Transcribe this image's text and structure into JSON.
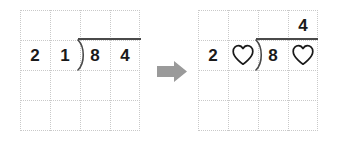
{
  "diagram": {
    "background_color": "#ffffff",
    "grid_line_color": "#c9c9c9",
    "ink_color": "#1a1a1a",
    "rule_color": "#4a4a4a",
    "arrow_color": "#9a9a9a"
  },
  "left_panel": {
    "name": "original-problem",
    "columns": 4,
    "rows": 4,
    "expression": "21 ) 84",
    "divisor_digits": [
      "2",
      "1"
    ],
    "dividend_digits": [
      "8",
      "4"
    ],
    "quotient_digits": [],
    "cells": [
      {
        "row": 1,
        "col": 0,
        "type": "digit",
        "value": "2"
      },
      {
        "row": 1,
        "col": 1,
        "type": "digit",
        "value": "1"
      },
      {
        "row": 1,
        "col": 2,
        "type": "digit",
        "value": "8"
      },
      {
        "row": 1,
        "col": 3,
        "type": "digit",
        "value": "4"
      }
    ],
    "division_bracket": {
      "present": true,
      "bar_label": "division-bar"
    }
  },
  "right_panel": {
    "name": "puzzle-problem",
    "columns": 4,
    "rows": 4,
    "expression": "2? ) 8?  =  4",
    "divisor_digits": [
      "2",
      "heart"
    ],
    "dividend_digits": [
      "8",
      "heart"
    ],
    "quotient_digits": [
      "4"
    ],
    "cells": [
      {
        "row": 0,
        "col": 3,
        "type": "digit",
        "value": "4"
      },
      {
        "row": 1,
        "col": 0,
        "type": "digit",
        "value": "2"
      },
      {
        "row": 1,
        "col": 1,
        "type": "heart",
        "value": "♡"
      },
      {
        "row": 1,
        "col": 2,
        "type": "digit",
        "value": "8"
      },
      {
        "row": 1,
        "col": 3,
        "type": "heart",
        "value": "♡"
      }
    ],
    "division_bracket": {
      "present": true,
      "bar_label": "division-bar"
    }
  },
  "arrow": {
    "name": "transform-arrow",
    "direction": "right",
    "color": "#9a9a9a"
  },
  "icons": {
    "heart": "heart-outline-icon",
    "arrow": "arrow-right-icon",
    "bracket": "division-bracket-icon"
  }
}
